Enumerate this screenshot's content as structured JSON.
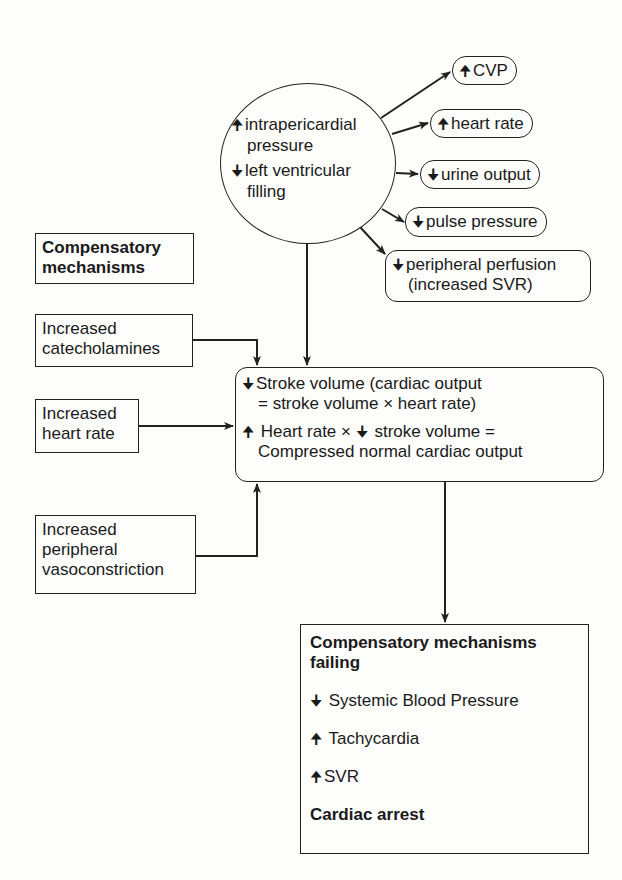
{
  "diagram": {
    "cause": {
      "lines": [
        {
          "arrow": "up",
          "glyph": "🠉",
          "text": "intrapericardial",
          "continuation": "pressure"
        },
        {
          "arrow": "down",
          "glyph": "🠋",
          "text": "left ventricular",
          "continuation": "filling"
        }
      ]
    },
    "effects": [
      {
        "arrow": "up",
        "glyph": "🠉",
        "text": "CVP"
      },
      {
        "arrow": "up",
        "glyph": "🠉",
        "text": "heart rate"
      },
      {
        "arrow": "down",
        "glyph": "🠋",
        "text": "urine output"
      },
      {
        "arrow": "down",
        "glyph": "🠋",
        "text": "pulse pressure"
      },
      {
        "arrow": "down",
        "glyph": "🠋",
        "text": "peripheral perfusion",
        "continuation": "(increased SVR)"
      }
    ],
    "compensatory_title": {
      "line1": "Compensatory",
      "line2": "mechanisms"
    },
    "mechanisms": [
      {
        "line1": "Increased",
        "line2": "catecholamines"
      },
      {
        "line1": "Increased",
        "line2": "heart rate"
      },
      {
        "line1": "Increased",
        "line2": "peripheral",
        "line3": "vasoconstriction"
      }
    ],
    "central": {
      "p1": {
        "glyph": "🠋",
        "line1": "Stroke volume (cardiac output",
        "line2": "= stroke volume × heart rate)"
      },
      "p2": {
        "glyph1": "🠉",
        "part1": "Heart rate × ",
        "glyph2": "🠋",
        "part2": "stroke volume =",
        "line2": "Compressed normal cardiac output"
      }
    },
    "failing": {
      "title_line1": "Compensatory mechanisms",
      "title_line2": "failing",
      "items": [
        {
          "arrow": "down",
          "glyph": "🠋",
          "text": "Systemic Blood Pressure"
        },
        {
          "arrow": "up",
          "glyph": "🠉",
          "text": "Tachycardia"
        },
        {
          "arrow": "up",
          "glyph": "🠉",
          "text": "SVR"
        }
      ],
      "outcome": "Cardiac arrest"
    },
    "colors": {
      "line": "#222222",
      "background": "#fdfdfb",
      "text": "#1a1a1a"
    }
  }
}
